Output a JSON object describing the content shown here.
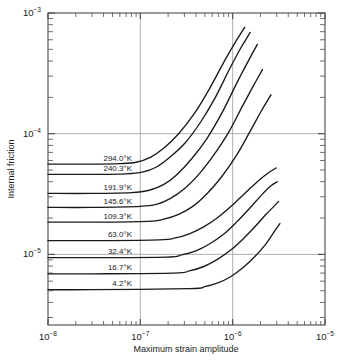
{
  "chart_data": {
    "type": "line",
    "title": "",
    "xlabel": "Maximum strain amplitude",
    "ylabel": "Internal friction",
    "xscale": "log",
    "yscale": "log",
    "xlim": [
      1e-08,
      1e-05
    ],
    "ylim": [
      2.6e-06,
      0.001
    ],
    "grid": true,
    "grid_lines": {
      "x": [
        "1e-7",
        "1e-6"
      ],
      "y": [
        "1e-4",
        "1e-5"
      ]
    },
    "legend_position": "inline-curve-labels",
    "xtick_labels": [
      "10−8",
      "10−7",
      "10−6",
      "10−5"
    ],
    "xtick_values": [
      1e-08,
      1e-07,
      1e-06,
      1e-05
    ],
    "ytick_labels": [
      "10−3",
      "10−4",
      "10−5"
    ],
    "ytick_values": [
      0.001,
      0.0001,
      1e-05
    ],
    "series": [
      {
        "name": "294.0°K",
        "plateau": 5.6e-05,
        "knee_x": 9e-08,
        "end_x": 1.35e-06,
        "end_y": 0.00076,
        "x": [
          1e-08,
          3e-08,
          6e-08,
          9e-08,
          1.3e-07,
          1.8e-07,
          2.6e-07,
          3.8e-07,
          5.5e-07,
          8e-07,
          1.05e-06,
          1.35e-06
        ],
        "y": [
          5.6e-05,
          5.6e-05,
          5.65e-05,
          5.8e-05,
          6.4e-05,
          7.6e-05,
          0.0001,
          0.000145,
          0.00023,
          0.00039,
          0.00056,
          0.00076
        ]
      },
      {
        "name": "240.3°K",
        "plateau": 4.6e-05,
        "knee_x": 1.05e-07,
        "end_x": 1.55e-06,
        "end_y": 0.00069,
        "x": [
          1e-08,
          3e-08,
          7e-08,
          1.05e-07,
          1.5e-07,
          2.1e-07,
          3.1e-07,
          4.5e-07,
          6.5e-07,
          9.2e-07,
          1.22e-06,
          1.55e-06
        ],
        "y": [
          4.6e-05,
          4.6e-05,
          4.65e-05,
          4.8e-05,
          5.3e-05,
          6.4e-05,
          8.5e-05,
          0.000125,
          0.0002,
          0.00034,
          0.00051,
          0.00069
        ]
      },
      {
        "name": "191.9°K",
        "plateau": 3.2e-05,
        "knee_x": 1.25e-07,
        "end_x": 1.85e-06,
        "end_y": 0.00055,
        "x": [
          1e-08,
          3e-08,
          8e-08,
          1.25e-07,
          1.8e-07,
          2.5e-07,
          3.6e-07,
          5.3e-07,
          7.7e-07,
          1.1e-06,
          1.45e-06,
          1.85e-06
        ],
        "y": [
          3.2e-05,
          3.2e-05,
          3.25e-05,
          3.4e-05,
          3.8e-05,
          4.6e-05,
          6.2e-05,
          9.2e-05,
          0.00015,
          0.00026,
          0.00039,
          0.00055
        ]
      },
      {
        "name": "145.6°K",
        "plateau": 2.45e-05,
        "knee_x": 1.5e-07,
        "end_x": 2.1e-06,
        "end_y": 0.00034,
        "x": [
          1e-08,
          3e-08,
          1e-07,
          1.5e-07,
          2.1e-07,
          3e-07,
          4.3e-07,
          6.2e-07,
          9e-07,
          1.28e-06,
          1.68e-06,
          2.1e-06
        ],
        "y": [
          2.45e-05,
          2.45e-05,
          2.5e-05,
          2.6e-05,
          2.9e-05,
          3.5e-05,
          4.6e-05,
          6.6e-05,
          0.000102,
          0.00017,
          0.00025,
          0.00034
        ]
      },
      {
        "name": "109.3°K",
        "plateau": 1.85e-05,
        "knee_x": 1.8e-07,
        "end_x": 2.6e-06,
        "end_y": 0.00021,
        "x": [
          1e-08,
          3e-08,
          1.2e-07,
          1.8e-07,
          2.6e-07,
          3.7e-07,
          5.3e-07,
          7.6e-07,
          1.1e-06,
          1.55e-06,
          2.05e-06,
          2.6e-06
        ],
        "y": [
          1.85e-05,
          1.85e-05,
          1.88e-05,
          1.96e-05,
          2.15e-05,
          2.5e-05,
          3.2e-05,
          4.4e-05,
          6.6e-05,
          0.000105,
          0.000155,
          0.00021
        ]
      },
      {
        "name": "63.0°K",
        "plateau": 1.3e-05,
        "knee_x": 2.4e-07,
        "end_x": 2.95e-06,
        "end_y": 5.2e-05,
        "x": [
          1e-08,
          3e-08,
          1.6e-07,
          2.4e-07,
          3.4e-07,
          4.8e-07,
          6.8e-07,
          9.6e-07,
          1.35e-06,
          1.85e-06,
          2.4e-06,
          2.95e-06
        ],
        "y": [
          1.3e-05,
          1.3e-05,
          1.32e-05,
          1.37e-05,
          1.48e-05,
          1.68e-05,
          2e-05,
          2.5e-05,
          3.2e-05,
          4e-05,
          4.7e-05,
          5.2e-05
        ]
      },
      {
        "name": "32.4°K",
        "plateau": 9.4e-06,
        "knee_x": 2.8e-07,
        "end_x": 3.05e-06,
        "end_y": 4e-05,
        "x": [
          1e-08,
          3e-08,
          1.9e-07,
          2.8e-07,
          4e-07,
          5.6e-07,
          7.9e-07,
          1.1e-06,
          1.52e-06,
          2.05e-06,
          2.6e-06,
          3.05e-06
        ],
        "y": [
          9.4e-06,
          9.4e-06,
          9.5e-06,
          9.9e-06,
          1.07e-05,
          1.22e-05,
          1.46e-05,
          1.85e-05,
          2.4e-05,
          3.1e-05,
          3.7e-05,
          4e-05
        ]
      },
      {
        "name": "16.7°K",
        "plateau": 6.9e-06,
        "knee_x": 3.4e-07,
        "end_x": 3.15e-06,
        "end_y": 2.75e-05,
        "x": [
          1e-08,
          3e-08,
          2.3e-07,
          3.4e-07,
          4.8e-07,
          6.7e-07,
          9.3e-07,
          1.28e-06,
          1.75e-06,
          2.3e-06,
          2.8e-06,
          3.15e-06
        ],
        "y": [
          6.9e-06,
          6.9e-06,
          7e-06,
          7.3e-06,
          7.9e-06,
          9e-06,
          1.07e-05,
          1.33e-05,
          1.7e-05,
          2.15e-05,
          2.5e-05,
          2.75e-05
        ]
      },
      {
        "name": "4.2°K",
        "plateau": 5.1e-06,
        "knee_x": 5e-07,
        "end_x": 3.25e-06,
        "end_y": 1.8e-05,
        "x": [
          1e-08,
          3e-08,
          3.4e-07,
          5e-07,
          6.9e-07,
          9.4e-07,
          1.28e-06,
          1.72e-06,
          2.25e-06,
          2.75e-06,
          3.05e-06,
          3.25e-06
        ],
        "y": [
          5.1e-06,
          5.1e-06,
          5.2e-06,
          5.4e-06,
          5.8e-06,
          6.5e-06,
          7.7e-06,
          9.5e-06,
          1.2e-05,
          1.5e-05,
          1.68e-05,
          1.8e-05
        ]
      }
    ],
    "curve_labels": [
      "294.0°K",
      "240.3°K",
      "191.9°K",
      "145.6°K",
      "109.3°K",
      "63.0°K",
      "32.4°K",
      "16.7°K",
      "4.2°K"
    ],
    "colors": {
      "curve": "#1a1a1a",
      "axis": "#4a4a4a",
      "grid": "#9a9a9a",
      "background": "#ffffff",
      "text": "#1a1a1a"
    }
  },
  "axes": {
    "x": {
      "label": "Maximum strain amplitude",
      "ticks": [
        {
          "mantissa": "10",
          "exponent": "−8"
        },
        {
          "mantissa": "10",
          "exponent": "−7"
        },
        {
          "mantissa": "10",
          "exponent": "−6"
        },
        {
          "mantissa": "10",
          "exponent": "−5"
        }
      ]
    },
    "y": {
      "label": "Internal friction",
      "ticks": [
        {
          "mantissa": "10",
          "exponent": "−3"
        },
        {
          "mantissa": "10",
          "exponent": "−4"
        },
        {
          "mantissa": "10",
          "exponent": "−5"
        }
      ]
    }
  }
}
